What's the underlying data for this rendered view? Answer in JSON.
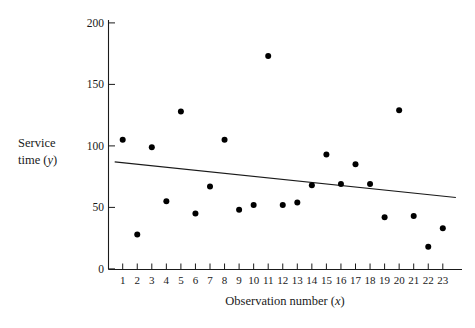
{
  "chart_data": {
    "type": "scatter",
    "title": "",
    "xlabel": "Observation number (x)",
    "ylabel": "Service time (y)",
    "ylabel_line1": "Service",
    "ylabel_line2_prefix": "time (",
    "ylabel_line2_var": "y",
    "ylabel_line2_suffix": ")",
    "xlabel_prefix": "Observation number (",
    "xlabel_var": "x",
    "xlabel_suffix": ")",
    "xlim": [
      0.3,
      23.7
    ],
    "ylim": [
      0,
      200
    ],
    "grid": false,
    "legend": "none",
    "y_ticks": [
      0,
      50,
      100,
      150,
      200
    ],
    "y_tick_labels": [
      "0",
      "50",
      "100",
      "150",
      "200"
    ],
    "x_ticks": [
      1,
      2,
      3,
      4,
      5,
      6,
      7,
      8,
      9,
      10,
      11,
      12,
      13,
      14,
      15,
      16,
      17,
      18,
      19,
      20,
      21,
      22,
      23
    ],
    "x_tick_labels": [
      "1",
      "2",
      "3",
      "4",
      "5",
      "6",
      "7",
      "8",
      "9",
      "10",
      "11",
      "12",
      "13",
      "14",
      "15",
      "16",
      "17",
      "18",
      "19",
      "20",
      "21",
      "22",
      "23"
    ],
    "x": [
      1,
      2,
      3,
      4,
      5,
      6,
      7,
      8,
      9,
      10,
      11,
      12,
      13,
      14,
      15,
      16,
      17,
      18,
      19,
      20,
      21,
      22,
      23
    ],
    "y": [
      105,
      28,
      99,
      55,
      128,
      45,
      67,
      105,
      48,
      52,
      173,
      52,
      54,
      68,
      93,
      69,
      85,
      69,
      42,
      129,
      43,
      18,
      33
    ],
    "point_color": "#000000",
    "point_marker": "circle",
    "point_size": 3.0,
    "trend_line": {
      "label": "least-squares trend line",
      "x_start": 0.45,
      "y_start": 87,
      "x_end": 23.9,
      "y_end": 58,
      "color": "#1a1a1a"
    }
  },
  "figure": {
    "caption": ""
  }
}
